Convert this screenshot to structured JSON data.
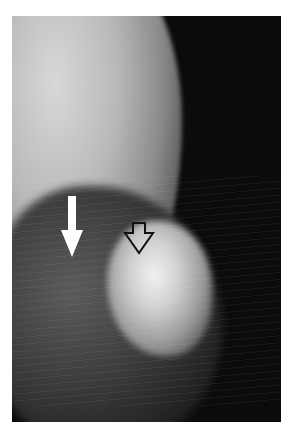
{
  "image": {
    "description": "Grayscale mammogram detail with two annotation arrows",
    "background_color": "#ffffff",
    "frame_color": "#0b0b0b"
  },
  "annotations": [
    {
      "type": "solid-arrow",
      "color": "#ffffff",
      "direction": "down"
    },
    {
      "type": "open-arrow",
      "color": "#111111",
      "fill": "#ffffff",
      "direction": "down"
    }
  ]
}
